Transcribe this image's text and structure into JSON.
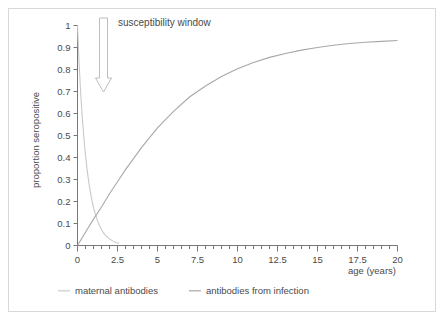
{
  "chart_data": {
    "type": "line",
    "title": "",
    "xlabel": "age (years)",
    "ylabel": "proportion seropositive",
    "xlim": [
      0,
      20
    ],
    "ylim": [
      0,
      1
    ],
    "grid": false,
    "legend_position": "bottom",
    "x_ticks": [
      0,
      2.5,
      5,
      7.5,
      10,
      12.5,
      15,
      17.5,
      20
    ],
    "x_tick_labels": [
      "0",
      "2.5",
      "5",
      "7.5",
      "10",
      "12.5",
      "15",
      "17.5",
      "20"
    ],
    "x_minor_step": 0.5,
    "y_ticks": [
      0,
      0.1,
      0.2,
      0.3,
      0.4,
      0.5,
      0.6,
      0.7,
      0.8,
      0.9,
      1
    ],
    "y_tick_labels": [
      "0",
      "0.1",
      "0.2",
      "0.3",
      "0.4",
      "0.5",
      "0.6",
      "0.7",
      "0.8",
      "0.9",
      "1"
    ],
    "series": [
      {
        "name": "maternal antibodies",
        "color": "#c9c9c9",
        "x": [
          0,
          0.1,
          0.2,
          0.3,
          0.4,
          0.5,
          0.6,
          0.7,
          0.8,
          0.9,
          1.0,
          1.1,
          1.2,
          1.3,
          1.4,
          1.5,
          1.6,
          1.7,
          1.8,
          1.9,
          2.0,
          2.2,
          2.4,
          2.6
        ],
        "values": [
          1.0,
          0.83,
          0.69,
          0.58,
          0.49,
          0.41,
          0.345,
          0.29,
          0.245,
          0.205,
          0.173,
          0.146,
          0.123,
          0.103,
          0.087,
          0.073,
          0.061,
          0.051,
          0.043,
          0.036,
          0.03,
          0.021,
          0.014,
          0.01
        ]
      },
      {
        "name": "antibodies from infection",
        "color": "#a8a8a8",
        "x": [
          0,
          0.5,
          1,
          1.5,
          2,
          2.5,
          3,
          3.5,
          4,
          4.5,
          5,
          6,
          7,
          8,
          9,
          10,
          11,
          12,
          13,
          14,
          15,
          16,
          17,
          18,
          19,
          20
        ],
        "values": [
          0.0,
          0.06,
          0.12,
          0.175,
          0.235,
          0.29,
          0.345,
          0.395,
          0.445,
          0.49,
          0.535,
          0.61,
          0.675,
          0.725,
          0.768,
          0.803,
          0.832,
          0.855,
          0.873,
          0.888,
          0.9,
          0.91,
          0.918,
          0.924,
          0.928,
          0.932
        ]
      }
    ],
    "annotations": [
      {
        "name": "susceptibility-window",
        "text": "susceptibility window",
        "arrow": "down-arrow"
      }
    ]
  },
  "legend": {
    "items": [
      {
        "label": "maternal antibodies",
        "color": "#c9c9c9"
      },
      {
        "label": "antibodies from infection",
        "color": "#a8a8a8"
      }
    ]
  },
  "colors": {
    "frame_border": "#d8d8d8",
    "axis": "#777777",
    "text": "#4a4a4a",
    "background": "#ffffff",
    "arrow_outline": "#bdbdbd"
  }
}
